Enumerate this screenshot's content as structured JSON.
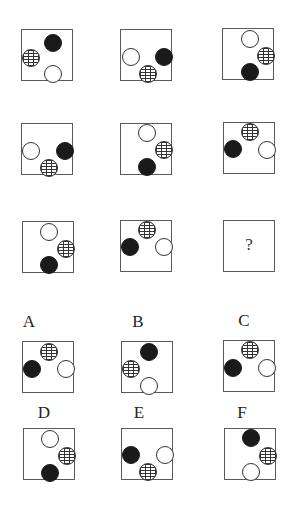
{
  "puzzle": {
    "question_mark": "?",
    "colors": {
      "black": "#1a1a1a",
      "white": "#ffffff",
      "outline": "#5a5a5a"
    },
    "grid": [
      {
        "id": "r1c1",
        "x": 21,
        "y": 29,
        "circles": [
          {
            "type": "black",
            "cx": 31,
            "cy": 13
          },
          {
            "type": "brick",
            "cx": 9,
            "cy": 28
          },
          {
            "type": "white",
            "cx": 31,
            "cy": 44
          }
        ]
      },
      {
        "id": "r1c2",
        "x": 120,
        "y": 29,
        "circles": [
          {
            "type": "white",
            "cx": 10,
            "cy": 27
          },
          {
            "type": "black",
            "cx": 43,
            "cy": 27
          },
          {
            "type": "brick",
            "cx": 27,
            "cy": 44
          }
        ]
      },
      {
        "id": "r1c3",
        "x": 222,
        "y": 28,
        "circles": [
          {
            "type": "white",
            "cx": 27,
            "cy": 10
          },
          {
            "type": "brick",
            "cx": 43,
            "cy": 27
          },
          {
            "type": "black",
            "cx": 27,
            "cy": 43
          }
        ]
      },
      {
        "id": "r2c1",
        "x": 21,
        "y": 123,
        "circles": [
          {
            "type": "white",
            "cx": 9,
            "cy": 27
          },
          {
            "type": "black",
            "cx": 43,
            "cy": 27
          },
          {
            "type": "brick",
            "cx": 27,
            "cy": 44
          }
        ]
      },
      {
        "id": "r2c2",
        "x": 120,
        "y": 123,
        "circles": [
          {
            "type": "white",
            "cx": 26,
            "cy": 9
          },
          {
            "type": "brick",
            "cx": 43,
            "cy": 26
          },
          {
            "type": "black",
            "cx": 26,
            "cy": 43
          }
        ]
      },
      {
        "id": "r2c3",
        "x": 223,
        "y": 122,
        "circles": [
          {
            "type": "brick",
            "cx": 26,
            "cy": 9
          },
          {
            "type": "black",
            "cx": 9,
            "cy": 26
          },
          {
            "type": "white",
            "cx": 43,
            "cy": 27
          }
        ]
      },
      {
        "id": "r3c1",
        "x": 22,
        "y": 221,
        "circles": [
          {
            "type": "white",
            "cx": 26,
            "cy": 10
          },
          {
            "type": "brick",
            "cx": 43,
            "cy": 27
          },
          {
            "type": "black",
            "cx": 26,
            "cy": 43
          }
        ]
      },
      {
        "id": "r3c2",
        "x": 120,
        "y": 220,
        "circles": [
          {
            "type": "brick",
            "cx": 26,
            "cy": 9
          },
          {
            "type": "black",
            "cx": 9,
            "cy": 26
          },
          {
            "type": "white",
            "cx": 43,
            "cy": 26
          }
        ]
      },
      {
        "id": "r3c3",
        "x": 223,
        "y": 220,
        "question": true,
        "circles": []
      }
    ],
    "options": [
      {
        "label": "A",
        "label_x": 21,
        "label_y": 312,
        "x": 22,
        "y": 341,
        "circles": [
          {
            "type": "brick",
            "cx": 26,
            "cy": 10
          },
          {
            "type": "black",
            "cx": 9,
            "cy": 27
          },
          {
            "type": "white",
            "cx": 43,
            "cy": 27
          }
        ]
      },
      {
        "label": "B",
        "label_x": 130,
        "label_y": 312,
        "x": 121,
        "y": 341,
        "circles": [
          {
            "type": "black",
            "cx": 27,
            "cy": 10
          },
          {
            "type": "brick",
            "cx": 9,
            "cy": 27
          },
          {
            "type": "white",
            "cx": 27,
            "cy": 44
          }
        ]
      },
      {
        "label": "C",
        "label_x": 236,
        "label_y": 311,
        "x": 223,
        "y": 340,
        "circles": [
          {
            "type": "brick",
            "cx": 26,
            "cy": 9
          },
          {
            "type": "black",
            "cx": 9,
            "cy": 27
          },
          {
            "type": "white",
            "cx": 43,
            "cy": 27
          }
        ]
      },
      {
        "label": "D",
        "label_x": 36,
        "label_y": 403,
        "x": 23,
        "y": 428,
        "circles": [
          {
            "type": "white",
            "cx": 26,
            "cy": 10
          },
          {
            "type": "brick",
            "cx": 43,
            "cy": 27
          },
          {
            "type": "black",
            "cx": 26,
            "cy": 44
          }
        ]
      },
      {
        "label": "E",
        "label_x": 131,
        "label_y": 403,
        "x": 121,
        "y": 428,
        "circles": [
          {
            "type": "black",
            "cx": 9,
            "cy": 26
          },
          {
            "type": "white",
            "cx": 43,
            "cy": 26
          },
          {
            "type": "brick",
            "cx": 26,
            "cy": 43
          }
        ]
      },
      {
        "label": "F",
        "label_x": 234,
        "label_y": 403,
        "x": 224,
        "y": 428,
        "circles": [
          {
            "type": "black",
            "cx": 26,
            "cy": 9
          },
          {
            "type": "brick",
            "cx": 43,
            "cy": 27
          },
          {
            "type": "white",
            "cx": 26,
            "cy": 43
          }
        ]
      }
    ]
  }
}
